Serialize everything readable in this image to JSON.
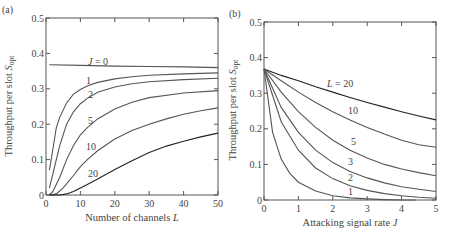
{
  "chart_data": [
    {
      "panel": "(a)",
      "type": "line",
      "title": "",
      "xlabel": "Number of channels L",
      "ylabel": "Throughput per slot S_opt",
      "xlim": [
        0,
        50
      ],
      "ylim": [
        0,
        0.5
      ],
      "xticks": [
        0,
        10,
        20,
        30,
        40,
        50
      ],
      "yticks": [
        0,
        0.1,
        0.2,
        0.3,
        0.4,
        0.5
      ],
      "grid": false,
      "series": [
        {
          "name": "J = 0",
          "label": "J = 0",
          "x": [
            1,
            10,
            20,
            30,
            40,
            50
          ],
          "y": [
            0.368,
            0.366,
            0.364,
            0.363,
            0.362,
            0.36
          ]
        },
        {
          "name": "J = 1",
          "label": "1",
          "x": [
            1,
            2,
            3,
            4,
            6,
            8,
            10,
            12,
            15,
            20,
            25,
            30,
            40,
            50
          ],
          "y": [
            0.07,
            0.13,
            0.19,
            0.22,
            0.26,
            0.285,
            0.298,
            0.308,
            0.318,
            0.328,
            0.334,
            0.338,
            0.342,
            0.345
          ]
        },
        {
          "name": "J = 2",
          "label": "2",
          "x": [
            1,
            2,
            3,
            4,
            6,
            8,
            10,
            12,
            15,
            20,
            25,
            30,
            40,
            50
          ],
          "y": [
            0.02,
            0.06,
            0.1,
            0.14,
            0.2,
            0.235,
            0.258,
            0.273,
            0.29,
            0.305,
            0.314,
            0.32,
            0.326,
            0.33
          ]
        },
        {
          "name": "J = 5",
          "label": "5",
          "x": [
            1,
            2,
            4,
            6,
            8,
            10,
            12,
            15,
            20,
            25,
            30,
            40,
            50
          ],
          "y": [
            0.0,
            0.01,
            0.05,
            0.1,
            0.14,
            0.17,
            0.19,
            0.215,
            0.243,
            0.262,
            0.275,
            0.288,
            0.295
          ]
        },
        {
          "name": "J = 10",
          "label": "10",
          "x": [
            1,
            3,
            5,
            8,
            10,
            12,
            15,
            20,
            25,
            30,
            35,
            40,
            45,
            50
          ],
          "y": [
            0.0,
            0.003,
            0.02,
            0.055,
            0.08,
            0.1,
            0.125,
            0.158,
            0.182,
            0.2,
            0.215,
            0.228,
            0.238,
            0.246
          ]
        },
        {
          "name": "J = 20",
          "label": "20",
          "x": [
            1,
            4,
            6,
            8,
            10,
            12,
            15,
            20,
            25,
            30,
            35,
            40,
            45,
            50
          ],
          "y": [
            0.0,
            0.0,
            0.003,
            0.01,
            0.02,
            0.03,
            0.045,
            0.072,
            0.097,
            0.12,
            0.138,
            0.152,
            0.164,
            0.175
          ]
        }
      ]
    },
    {
      "panel": "(b)",
      "type": "line",
      "title": "",
      "xlabel": "Attacking signal rate J",
      "ylabel": "Throughput per slot S_opt",
      "xlim": [
        0,
        5
      ],
      "ylim": [
        0,
        0.5
      ],
      "xticks": [
        0,
        1,
        2,
        3,
        4,
        5
      ],
      "yticks": [
        0,
        0.1,
        0.2,
        0.3,
        0.4,
        0.5
      ],
      "grid": false,
      "series": [
        {
          "name": "L = 20",
          "label": "L = 20",
          "x": [
            0,
            0.5,
            1,
            1.5,
            2,
            2.5,
            3,
            3.5,
            4,
            4.5,
            5
          ],
          "y": [
            0.368,
            0.35,
            0.335,
            0.318,
            0.303,
            0.288,
            0.274,
            0.261,
            0.248,
            0.236,
            0.225
          ]
        },
        {
          "name": "L = 10",
          "label": "10",
          "x": [
            0,
            0.5,
            1,
            1.5,
            2,
            2.5,
            3,
            3.5,
            4,
            4.5,
            5
          ],
          "y": [
            0.368,
            0.335,
            0.303,
            0.274,
            0.248,
            0.225,
            0.204,
            0.185,
            0.168,
            0.155,
            0.148
          ]
        },
        {
          "name": "L = 5",
          "label": "5",
          "x": [
            0,
            0.5,
            1,
            1.5,
            2,
            2.5,
            3,
            3.5,
            4,
            4.5,
            5
          ],
          "y": [
            0.368,
            0.303,
            0.248,
            0.204,
            0.168,
            0.14,
            0.118,
            0.1,
            0.087,
            0.077,
            0.068
          ]
        },
        {
          "name": "L = 3",
          "label": "3",
          "x": [
            0,
            0.5,
            1,
            1.5,
            2,
            2.5,
            3,
            3.5,
            4,
            4.5,
            5
          ],
          "y": [
            0.368,
            0.26,
            0.19,
            0.14,
            0.105,
            0.08,
            0.062,
            0.048,
            0.037,
            0.03,
            0.024
          ]
        },
        {
          "name": "L = 2",
          "label": "2",
          "x": [
            0,
            0.5,
            1,
            1.5,
            2,
            2.5,
            3,
            3.5,
            4,
            4.5,
            5
          ],
          "y": [
            0.368,
            0.22,
            0.14,
            0.09,
            0.06,
            0.04,
            0.027,
            0.018,
            0.012,
            0.008,
            0.005
          ]
        },
        {
          "name": "L = 1",
          "label": "1",
          "x": [
            0,
            0.25,
            0.5,
            0.75,
            1,
            1.5,
            2,
            2.5,
            3,
            3.5,
            4,
            4.4
          ],
          "y": [
            0.368,
            0.19,
            0.115,
            0.075,
            0.05,
            0.025,
            0.012,
            0.006,
            0.003,
            0.001,
            0.0,
            0.0
          ]
        }
      ]
    }
  ],
  "panels": {
    "a": {
      "label": "(a)",
      "xlabel_main": "Number of channels ",
      "xlabel_var": "L",
      "ylabel_main": "Throughput per slot ",
      "ylabel_var": "S",
      "ylabel_sub": "opt"
    },
    "b": {
      "label": "(b)",
      "xlabel_main": "Attacking signal rate ",
      "xlabel_var": "J",
      "ylabel_main": "Throughput per slot ",
      "ylabel_var": "S",
      "ylabel_sub": "opt"
    }
  }
}
